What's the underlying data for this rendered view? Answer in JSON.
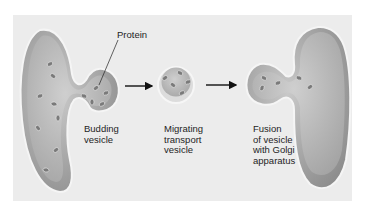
{
  "diagram": {
    "colors": {
      "panel_background": "#ececec",
      "organelle_fill": "#a8a8a8",
      "organelle_lumen": "#c4c4c4",
      "membrane": "#f4f4f4",
      "protein": "#7a7a7a",
      "arrow": "#111111",
      "text": "#1e1e1e"
    },
    "labels": {
      "protein": "Protein",
      "budding": "Budding\nvesicle",
      "migrating": "Migrating\ntransport\nvesicle",
      "fusion": "Fusion\nof vesicle\nwith Golgi\napparatus"
    },
    "stages": [
      {
        "name": "Budding vesicle"
      },
      {
        "name": "Migrating transport vesicle"
      },
      {
        "name": "Fusion of vesicle with Golgi apparatus"
      }
    ],
    "arrows": [
      {
        "from": "Budding vesicle",
        "to": "Migrating transport vesicle"
      },
      {
        "from": "Migrating transport vesicle",
        "to": "Fusion of vesicle with Golgi apparatus"
      }
    ]
  }
}
